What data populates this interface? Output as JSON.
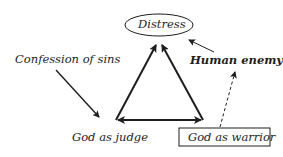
{
  "diagram": {
    "nodes": {
      "distress": {
        "label": "Distress",
        "shape": "ellipse"
      },
      "confession": {
        "label": "Confession of sins",
        "shape": "text"
      },
      "human_enemy": {
        "label": "Human enemy",
        "shape": "text",
        "emphasis": "bold"
      },
      "god_judge": {
        "label": "God as judge",
        "shape": "text"
      },
      "god_warrior": {
        "label": "God as warrior",
        "shape": "box"
      }
    },
    "edges": [
      {
        "from": "god_judge",
        "to": "distress",
        "style": "solid-thick"
      },
      {
        "from": "god_warrior",
        "to": "distress",
        "style": "solid-thick"
      },
      {
        "from": "god_judge",
        "to": "god_warrior",
        "style": "solid-thick",
        "bidirectional": true
      },
      {
        "from": "confession",
        "to": "god_judge",
        "style": "solid"
      },
      {
        "from": "human_enemy",
        "to": "distress",
        "style": "solid-thin"
      },
      {
        "from": "god_warrior",
        "to": "human_enemy",
        "style": "dashed"
      }
    ],
    "colors": {
      "stroke": "#1e1e1e",
      "background": "#ffffff"
    }
  }
}
